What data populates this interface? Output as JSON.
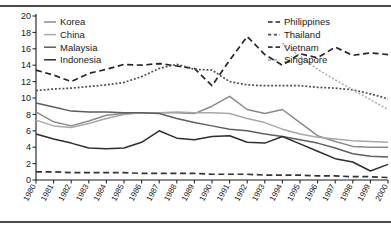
{
  "chart_data": {
    "type": "line",
    "title": "",
    "subtitle": "",
    "xlabel": "",
    "ylabel": "",
    "xlim": [
      1980,
      2000
    ],
    "ylim": [
      0,
      20
    ],
    "ytick_step": 2,
    "grid": false,
    "legend_position": "inside-top-left and inside-top-right",
    "x": [
      1980,
      1981,
      1982,
      1983,
      1984,
      1985,
      1986,
      1987,
      1988,
      1989,
      1990,
      1991,
      1992,
      1993,
      1994,
      1995,
      1996,
      1997,
      1998,
      1999,
      2000
    ],
    "xtick_labels": [
      "1980",
      "1981",
      "1982",
      "1983",
      "1984",
      "1985",
      "1986",
      "1987",
      "1988",
      "1989",
      "1990",
      "1991",
      "1992",
      "1993",
      "1994",
      "1995",
      "1996",
      "1997",
      "1998",
      "1999",
      "2000"
    ],
    "ytick_labels": [
      "0",
      "2",
      "4",
      "6",
      "8",
      "10",
      "12",
      "14",
      "16",
      "18",
      "20"
    ],
    "series": [
      {
        "name": "Korea",
        "style": "solid",
        "color": "#8a8a8a",
        "values": [
          8.3,
          7.1,
          6.6,
          7.2,
          7.9,
          8.1,
          8.2,
          8.2,
          8.2,
          8.1,
          9.0,
          10.2,
          8.6,
          8.1,
          8.6,
          7.0,
          5.4,
          4.7,
          4.1,
          4.0,
          4.0
        ]
      },
      {
        "name": "China",
        "style": "solid",
        "color": "#a8a8a8",
        "values": [
          7.3,
          6.6,
          6.4,
          6.9,
          7.5,
          8.0,
          8.2,
          8.2,
          8.3,
          8.2,
          8.2,
          8.1,
          7.5,
          7.0,
          6.2,
          5.6,
          5.2,
          5.0,
          4.8,
          4.7,
          4.6
        ]
      },
      {
        "name": "Malaysia",
        "style": "solid",
        "color": "#5e5e5e",
        "values": [
          9.4,
          8.9,
          8.4,
          8.3,
          8.3,
          8.2,
          8.2,
          8.1,
          7.5,
          7.0,
          6.6,
          6.2,
          6.0,
          5.6,
          5.3,
          4.9,
          4.5,
          3.9,
          3.2,
          2.9,
          2.8
        ]
      },
      {
        "name": "Indonesia",
        "style": "solid",
        "color": "#2e2e2e",
        "values": [
          5.6,
          5.0,
          4.5,
          3.9,
          3.8,
          3.9,
          4.6,
          6.0,
          5.1,
          4.9,
          5.3,
          5.4,
          4.6,
          4.5,
          5.3,
          4.4,
          3.5,
          2.6,
          2.2,
          1.1,
          1.9
        ]
      },
      {
        "name": "Philippines",
        "style": "dashed",
        "color": "#262626",
        "values": [
          13.4,
          12.8,
          12.0,
          13.0,
          13.5,
          14.1,
          14.0,
          14.2,
          13.9,
          13.6,
          11.5,
          14.6,
          17.5,
          15.3,
          14.0,
          15.4,
          14.9,
          16.2,
          15.2,
          15.5,
          15.3
        ]
      },
      {
        "name": "Thailand",
        "style": "dotted",
        "color": "#4d4d4d",
        "values": [
          10.9,
          11.1,
          11.2,
          11.4,
          11.6,
          11.9,
          12.6,
          13.6,
          14.1,
          13.5,
          13.4,
          12.0,
          11.6,
          11.5,
          11.5,
          11.5,
          11.3,
          11.2,
          11.0,
          10.5,
          9.9
        ]
      },
      {
        "name": "Vietnam",
        "style": "dashed",
        "color": "#333333",
        "values": [
          1.0,
          1.0,
          0.9,
          0.9,
          0.9,
          0.9,
          0.8,
          0.8,
          0.8,
          0.8,
          0.7,
          0.7,
          0.7,
          0.6,
          0.6,
          0.6,
          0.5,
          0.5,
          0.4,
          0.4,
          0.3
        ]
      },
      {
        "name": "Singapore",
        "style": "dotted",
        "color": "#b0b0b0",
        "values": [
          null,
          null,
          null,
          null,
          null,
          null,
          null,
          null,
          null,
          null,
          null,
          null,
          null,
          null,
          16.7,
          15.1,
          13.5,
          12.2,
          11.0,
          9.8,
          8.6
        ]
      }
    ],
    "legend_left": [
      "Korea",
      "China",
      "Malaysia",
      "Indonesia"
    ],
    "legend_right": [
      "Philippines",
      "Thailand",
      "Vietnam",
      "Singapore"
    ]
  },
  "legend": {
    "left": [
      {
        "label": "Korea"
      },
      {
        "label": "China"
      },
      {
        "label": "Malaysia"
      },
      {
        "label": "Indonesia"
      }
    ],
    "right": [
      {
        "label": "Philippines"
      },
      {
        "label": "Thailand"
      },
      {
        "label": "Vietnam"
      },
      {
        "label": "Singapore"
      }
    ]
  }
}
